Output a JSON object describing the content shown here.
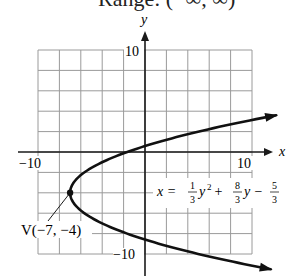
{
  "header": {
    "cut_off_text": "Range: (−∞, ∞)"
  },
  "chart_data": {
    "type": "line",
    "title": "",
    "xlabel": "x",
    "ylabel": "y",
    "xlim": [
      -10,
      10
    ],
    "ylim": [
      -10,
      10
    ],
    "grid": true,
    "grid_step": 2,
    "x_tick_labels": [
      {
        "value": -10,
        "label": "−10"
      },
      {
        "value": 10,
        "label": "10"
      }
    ],
    "y_tick_labels": [
      {
        "value": 10,
        "label": "10"
      },
      {
        "value": -10,
        "label": "−10"
      }
    ],
    "series": [
      {
        "name": "x = (1/3)y^2 + (8/3)y − 5/3",
        "equation": {
          "a": 0.3333333,
          "b": 2.6666667,
          "c": -1.6666667,
          "form": "x = a*y^2 + b*y + c"
        },
        "y_range": [
          -11.5,
          3.6
        ],
        "points": [
          {
            "x": 12.25,
            "y": 3.6
          },
          {
            "x": 5,
            "y": 2
          },
          {
            "x": -1.667,
            "y": 0
          },
          {
            "x": -5.667,
            "y": -2
          },
          {
            "x": -7,
            "y": -4
          },
          {
            "x": -5.667,
            "y": -6
          },
          {
            "x": -1.667,
            "y": -8
          },
          {
            "x": 5,
            "y": -10
          },
          {
            "x": 11.75,
            "y": -11.5
          }
        ],
        "color": "#111111"
      }
    ],
    "annotations": [
      {
        "type": "vertex",
        "label": "V(−7, −4)",
        "x": -7,
        "y": -4
      },
      {
        "type": "equation",
        "parts": {
          "x_eq": "x = ",
          "frac1_num": "1",
          "frac1_den": "3",
          "term1": "y",
          "sup": "2",
          "plus": " + ",
          "frac2_num": "8",
          "frac2_den": "3",
          "term2": "y",
          "minus": " − ",
          "frac3_num": "5",
          "frac3_den": "3"
        }
      }
    ]
  },
  "colors": {
    "grid": "#9a9a9a",
    "axis": "#1a1a1a",
    "curve": "#111111",
    "background": "#ffffff"
  }
}
